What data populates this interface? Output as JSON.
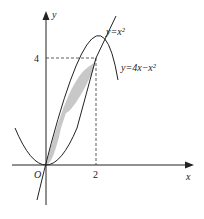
{
  "diagram": {
    "axes": {
      "x_label": "x",
      "y_label": "y",
      "origin_label": "O"
    },
    "ticks": {
      "x_tick": "2",
      "y_tick": "4"
    },
    "curves": [
      {
        "name": "parabola-up",
        "label": "y=x²"
      },
      {
        "name": "parabola-down",
        "label": "y=4x−x²"
      }
    ],
    "shaded_region": {
      "between": [
        "y=x²",
        "y=4x−x²"
      ],
      "x_range": [
        0,
        2
      ],
      "fill": "#c8c8c8"
    },
    "intersection_point": {
      "x": 2,
      "y": 4
    }
  }
}
